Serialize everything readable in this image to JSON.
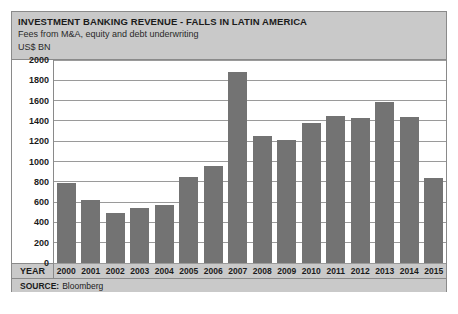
{
  "header": {
    "title": "INVESTMENT BANKING REVENUE - FALLS IN LATIN AMERICA",
    "subtitle": "Fees from M&A, equity and debt underwriting",
    "units": "US$ BN"
  },
  "axis": {
    "year_row_label": "YEAR"
  },
  "source": {
    "label": "SOURCE:",
    "value": "Bloomberg"
  },
  "colors": {
    "bar": "#737373",
    "header_band": "#c9c9c9",
    "frame": "#8a8a8a",
    "gridline": "#9a9a9a",
    "plot_background": "#ffffff"
  },
  "chart_data": {
    "type": "bar",
    "title": "INVESTMENT BANKING REVENUE - FALLS IN LATIN AMERICA",
    "subtitle": "Fees from M&A, equity and debt underwriting",
    "xlabel": "YEAR",
    "ylabel": "US$ BN",
    "ylim": [
      0,
      2000
    ],
    "yticks": [
      0,
      200,
      400,
      600,
      800,
      1000,
      1200,
      1400,
      1600,
      1800,
      2000
    ],
    "ytick_labels": [
      "0",
      "200",
      "400",
      "600",
      "800",
      "1000",
      "1200",
      "1400",
      "1600",
      "1800",
      "2000"
    ],
    "grid": true,
    "legend": false,
    "categories": [
      "2000",
      "2001",
      "2002",
      "2003",
      "2004",
      "2005",
      "2006",
      "2007",
      "2008",
      "2009",
      "2010",
      "2011",
      "2012",
      "2013",
      "2014",
      "2015"
    ],
    "values": [
      790,
      620,
      490,
      540,
      575,
      850,
      960,
      1880,
      1255,
      1215,
      1380,
      1450,
      1430,
      1590,
      1440,
      840
    ],
    "source": "SOURCE: Bloomberg"
  }
}
